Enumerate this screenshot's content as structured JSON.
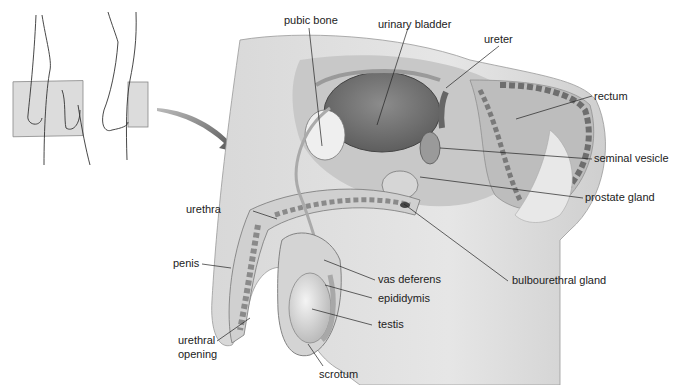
{
  "diagram": {
    "type": "anatomical cross-section",
    "inset": "orientation figure showing sagittal plane through the body"
  },
  "labels": {
    "pubic_bone": "pubic bone",
    "urinary_bladder": "urinary bladder",
    "ureter": "ureter",
    "rectum": "rectum",
    "seminal_vesicle": "seminal vesicle",
    "prostate_gland": "prostate gland",
    "urethra": "urethra",
    "bulbourethral_gland": "bulbourethral gland",
    "penis": "penis",
    "vas_deferens": "vas deferens",
    "epididymis": "epididymis",
    "testis": "testis",
    "urethral_opening_1": "urethral",
    "urethral_opening_2": "opening",
    "scrotum": "scrotum"
  },
  "colors": {
    "line": "#222222",
    "tissue_light": "#e4e4e4",
    "tissue_mid": "#b8b8b8",
    "tissue_dark": "#7a7a7a",
    "plane": "#d6d6d6"
  }
}
